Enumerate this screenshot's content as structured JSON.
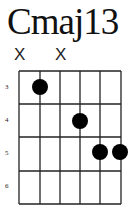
{
  "chord": {
    "name": "Cmaj13",
    "muted_strings": [
      {
        "string": 1,
        "label": "X"
      },
      {
        "string": 3,
        "label": "X"
      }
    ],
    "fret_labels": [
      "3",
      "4",
      "5",
      "6"
    ],
    "dots": [
      {
        "string": 2,
        "fret_row": 1
      },
      {
        "string": 4,
        "fret_row": 2
      },
      {
        "string": 5,
        "fret_row": 3
      },
      {
        "string": 6,
        "fret_row": 3
      }
    ],
    "strings": 6,
    "frets_shown": 4,
    "colors": {
      "line": "#222222",
      "dot": "#000000",
      "background": "#ffffff"
    }
  }
}
